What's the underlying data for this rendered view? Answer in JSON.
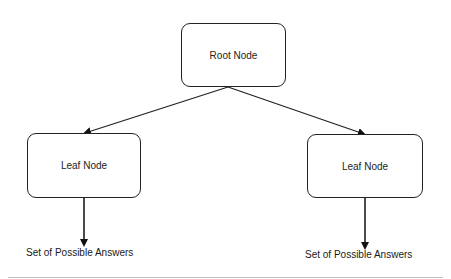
{
  "diagram": {
    "type": "tree",
    "nodes": {
      "root": {
        "label": "Root Node"
      },
      "leaf_left": {
        "label": "Leaf Node"
      },
      "leaf_right": {
        "label": "Leaf Node"
      }
    },
    "outputs": {
      "left": {
        "label": "Set of Possible Answers"
      },
      "right": {
        "label": "Set of Possible Answers"
      }
    },
    "edges": [
      {
        "from": "root",
        "to": "leaf_left"
      },
      {
        "from": "root",
        "to": "leaf_right"
      },
      {
        "from": "leaf_left",
        "to": "answers_left"
      },
      {
        "from": "leaf_right",
        "to": "answers_right"
      }
    ],
    "colors": {
      "stroke": "#222222",
      "background": "#ffffff"
    }
  }
}
